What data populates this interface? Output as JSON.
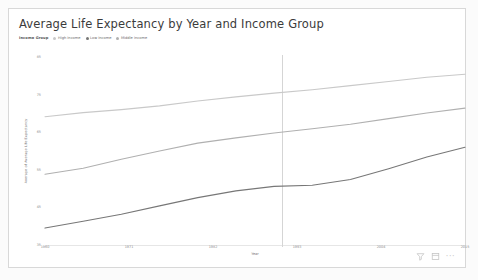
{
  "card": {
    "title": "Average Life Expectancy by Year and Income Group"
  },
  "legend": {
    "title": "Income Group",
    "items": [
      {
        "label": "High income",
        "color": "#c9c9c9"
      },
      {
        "label": "Low income",
        "color": "#777777"
      },
      {
        "label": "Middle income",
        "color": "#b0b0b0"
      }
    ]
  },
  "footer": {
    "filter_icon": "filter-icon",
    "focus_icon": "focus-mode-icon",
    "more_label": "···"
  },
  "chart_data": {
    "type": "line",
    "title": "Average Life Expectancy by Year and Income Group",
    "xlabel": "Year",
    "ylabel": "Average of Average Life Expectancy",
    "legend_position": "top-left",
    "grid": false,
    "xlim": [
      1960,
      2015
    ],
    "ylim": [
      35,
      85
    ],
    "xticks": [
      1960,
      1971,
      1982,
      1993,
      2004,
      2015
    ],
    "xticklabels": [
      "1960",
      "1971",
      "1982",
      "1993",
      "2004",
      "2015"
    ],
    "yticks": [
      35,
      45,
      55,
      65,
      75,
      85
    ],
    "yticklabels": [
      "35",
      "45",
      "55",
      "65",
      "75",
      "85"
    ],
    "reference_line": {
      "x": 1991,
      "label": ""
    },
    "x": [
      1960,
      1965,
      1970,
      1975,
      1980,
      1985,
      1990,
      1995,
      2000,
      2005,
      2010,
      2015
    ],
    "series": [
      {
        "name": "High income",
        "color": "#c9c9c9",
        "values": [
          69.1,
          70.2,
          71.0,
          72.0,
          73.3,
          74.4,
          75.4,
          76.3,
          77.4,
          78.5,
          79.6,
          80.4
        ]
      },
      {
        "name": "Middle income",
        "color": "#b0b0b0",
        "values": [
          53.8,
          55.4,
          57.8,
          60.0,
          62.1,
          63.5,
          64.8,
          65.9,
          67.1,
          68.6,
          70.1,
          71.4
        ]
      },
      {
        "name": "Low income",
        "color": "#777777",
        "values": [
          39.5,
          41.3,
          43.2,
          45.4,
          47.6,
          49.4,
          50.6,
          50.9,
          52.4,
          55.3,
          58.4,
          61.0
        ]
      }
    ]
  }
}
